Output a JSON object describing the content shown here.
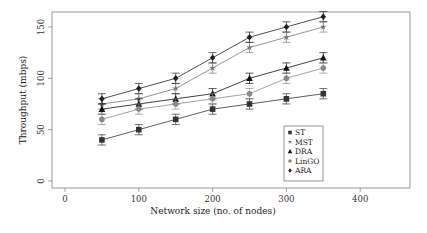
{
  "chart_data": {
    "type": "line",
    "title": "",
    "xlabel": "Network size (no. of nodes)",
    "ylabel": "Throughput (mbps)",
    "x": [
      50,
      100,
      150,
      200,
      250,
      300,
      350
    ],
    "xticks": [
      0,
      100,
      200,
      300,
      400
    ],
    "yticks": [
      0,
      50,
      100,
      150
    ],
    "xlim": [
      -15,
      470
    ],
    "ylim": [
      -5,
      165
    ],
    "grid": false,
    "error_bars": true,
    "error_bar_halfwidth": 5,
    "legend_position": "lower right (inside)",
    "series": [
      {
        "name": "ST",
        "marker": "square",
        "color": "#333333",
        "values": [
          40,
          50,
          60,
          70,
          75,
          80,
          85
        ]
      },
      {
        "name": "MST",
        "marker": "star",
        "color": "#777777",
        "values": [
          75,
          80,
          90,
          110,
          130,
          140,
          150
        ]
      },
      {
        "name": "DRA",
        "marker": "triangle",
        "color": "#111111",
        "values": [
          70,
          75,
          80,
          85,
          100,
          110,
          120
        ]
      },
      {
        "name": "LinGO",
        "marker": "circle",
        "color": "#8a8a8a",
        "values": [
          60,
          70,
          75,
          80,
          85,
          100,
          110
        ]
      },
      {
        "name": "ARA",
        "marker": "diamond",
        "color": "#222222",
        "values": [
          80,
          90,
          100,
          120,
          140,
          150,
          160
        ]
      }
    ]
  }
}
